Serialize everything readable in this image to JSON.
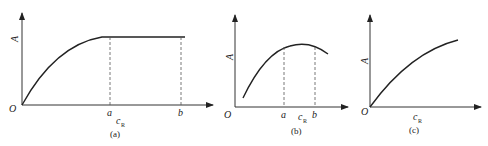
{
  "panels": [
    {
      "id": "a",
      "caption": "(a)",
      "y_label": "A",
      "x_label": "c",
      "x_label_sub": "R",
      "origin": "O",
      "ticks": [
        "a",
        "b"
      ],
      "curve": "rises concavely from origin to a, then constant plateau from a to b"
    },
    {
      "id": "b",
      "caption": "(b)",
      "y_label": "A",
      "x_label": "c",
      "x_label_sub": "R",
      "origin": "O",
      "ticks": [
        "a",
        "b"
      ],
      "curve": "rises to a maximum between a and b, then slightly decreases"
    },
    {
      "id": "c",
      "caption": "(c)",
      "y_label": "A",
      "x_label": "c",
      "x_label_sub": "R",
      "origin": "O",
      "ticks": [],
      "curve": "monotonically increasing concave curve from origin"
    }
  ],
  "colors": {
    "line": "#222222",
    "dash": "#555555"
  }
}
